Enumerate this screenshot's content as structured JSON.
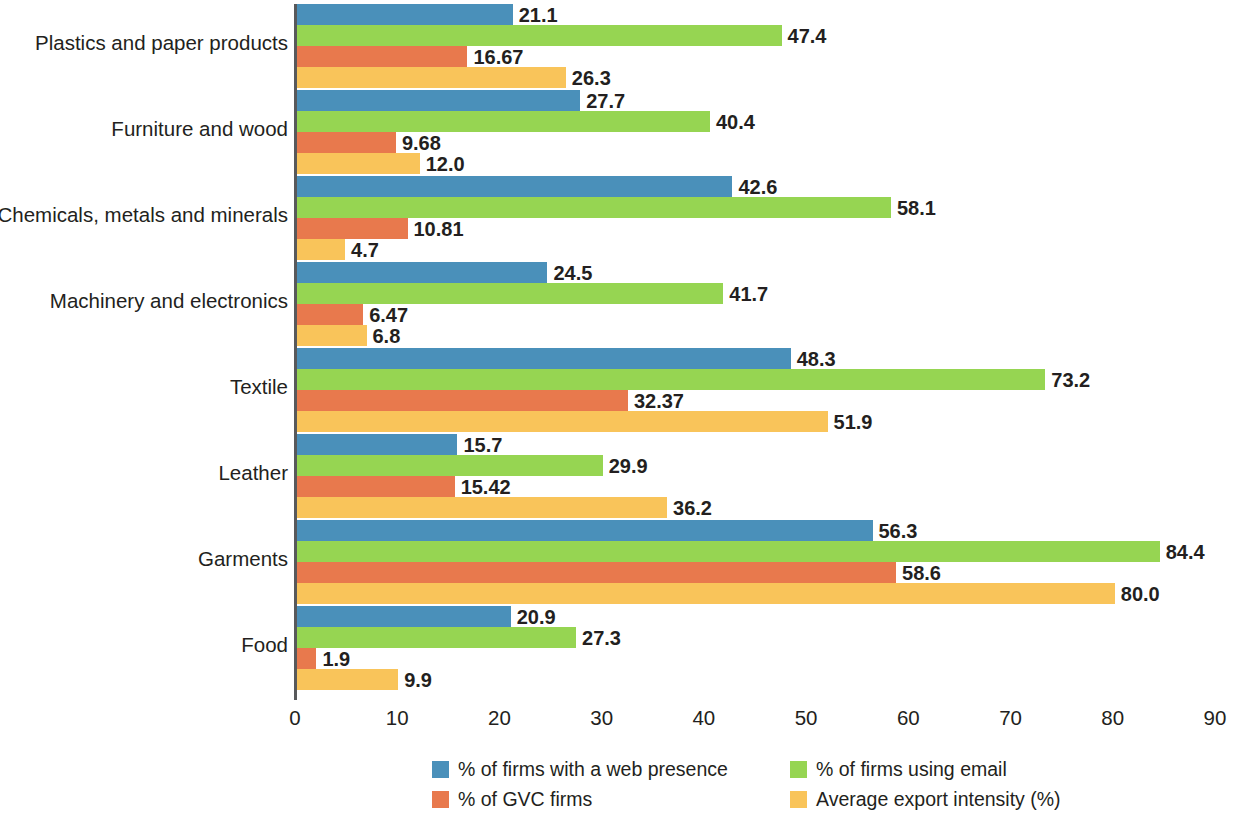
{
  "chart_data": {
    "type": "bar",
    "orientation": "horizontal",
    "title": "",
    "xlabel": "",
    "ylabel": "",
    "xlim": [
      0,
      90
    ],
    "xticks": [
      "0",
      "10",
      "20",
      "30",
      "40",
      "50",
      "60",
      "70",
      "80",
      "90"
    ],
    "grid": false,
    "legend_position": "bottom",
    "categories": [
      "Plastics and paper products",
      "Furniture and wood",
      "Chemicals, metals and minerals",
      "Machinery and electronics",
      "Textile",
      "Leather",
      "Garments",
      "Food"
    ],
    "series": [
      {
        "name": "% of firms with a web presence",
        "color": "#4a90ba",
        "values": [
          21.1,
          27.7,
          42.6,
          24.5,
          48.3,
          15.7,
          56.3,
          20.9
        ],
        "labels": [
          "21.1",
          "27.7",
          "42.6",
          "24.5",
          "48.3",
          "15.7",
          "56.3",
          "20.9"
        ]
      },
      {
        "name": "% of firms using email",
        "color": "#96d552",
        "values": [
          47.4,
          40.4,
          58.1,
          41.7,
          73.2,
          29.9,
          84.4,
          27.3
        ],
        "labels": [
          "47.4",
          "40.4",
          "58.1",
          "41.7",
          "73.2",
          "29.9",
          "84.4",
          "27.3"
        ]
      },
      {
        "name": "% of GVC firms",
        "color": "#e8794d",
        "values": [
          16.67,
          9.68,
          10.81,
          6.47,
          32.37,
          15.42,
          58.6,
          1.9
        ],
        "labels": [
          "16.67",
          "9.68",
          "10.81",
          "6.47",
          "32.37",
          "15.42",
          "58.6",
          "1.9"
        ]
      },
      {
        "name": "Average export intensity (%)",
        "color": "#f9c45a",
        "values": [
          26.3,
          12.0,
          4.7,
          6.8,
          51.9,
          36.2,
          80.0,
          9.9
        ],
        "labels": [
          "26.3",
          "12.0",
          "4.7",
          "6.8",
          "51.9",
          "36.2",
          "80.0",
          "9.9"
        ]
      }
    ]
  },
  "legend": {
    "items": [
      {
        "label": "% of firms with a web presence",
        "color": "#4a90ba"
      },
      {
        "label": "% of firms using email",
        "color": "#96d552"
      },
      {
        "label": "% of GVC firms",
        "color": "#e8794d"
      },
      {
        "label": "Average export intensity (%)",
        "color": "#f9c45a"
      }
    ]
  }
}
